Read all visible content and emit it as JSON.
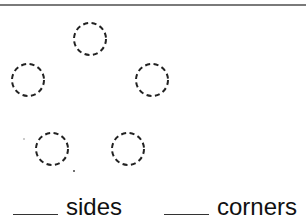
{
  "worksheet": {
    "shape": {
      "type": "dashed-circle-vertices",
      "count": 5,
      "dots": [
        {
          "cx": 90,
          "cy": 39
        },
        {
          "cx": 28,
          "cy": 80
        },
        {
          "cx": 152,
          "cy": 80
        },
        {
          "cx": 52,
          "cy": 149
        },
        {
          "cx": 128,
          "cy": 149
        }
      ]
    },
    "answers": [
      {
        "blank": "____",
        "label": "sides"
      },
      {
        "blank": "____",
        "label": "corners"
      }
    ]
  }
}
